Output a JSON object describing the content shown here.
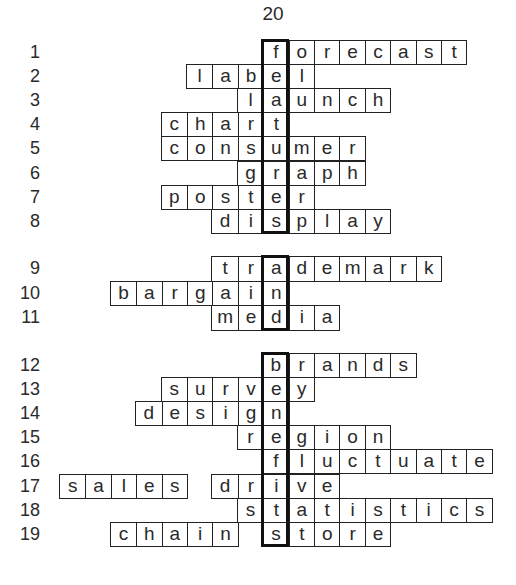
{
  "puzzle": {
    "title": "20",
    "grid": {
      "origin_x": 59,
      "cell_w": 25.4,
      "highlight_col": 8
    },
    "groups": [
      {
        "top": 40,
        "row_h": 24.1,
        "rows": [
          {
            "num": "1",
            "words": [
              {
                "col": 8,
                "text": "forecast"
              }
            ]
          },
          {
            "num": "2",
            "words": [
              {
                "col": 5,
                "text": "label"
              }
            ]
          },
          {
            "num": "3",
            "words": [
              {
                "col": 7,
                "text": "launch"
              }
            ]
          },
          {
            "num": "4",
            "words": [
              {
                "col": 4,
                "text": "chart"
              }
            ]
          },
          {
            "num": "5",
            "words": [
              {
                "col": 4,
                "text": "consumer"
              }
            ]
          },
          {
            "num": "6",
            "words": [
              {
                "col": 7,
                "text": "graph"
              }
            ]
          },
          {
            "num": "7",
            "words": [
              {
                "col": 4,
                "text": "poster"
              }
            ]
          },
          {
            "num": "8",
            "words": [
              {
                "col": 6,
                "text": "display"
              }
            ]
          }
        ]
      },
      {
        "top": 256,
        "row_h": 24.7,
        "rows": [
          {
            "num": "9",
            "words": [
              {
                "col": 6,
                "text": "trademark"
              }
            ]
          },
          {
            "num": "10",
            "words": [
              {
                "col": 2,
                "text": "bargain"
              }
            ]
          },
          {
            "num": "11",
            "words": [
              {
                "col": 6,
                "text": "media"
              }
            ]
          }
        ]
      },
      {
        "top": 353,
        "row_h": 24.1,
        "rows": [
          {
            "num": "12",
            "words": [
              {
                "col": 8,
                "text": "brands"
              }
            ]
          },
          {
            "num": "13",
            "words": [
              {
                "col": 4,
                "text": "survey"
              }
            ]
          },
          {
            "num": "14",
            "words": [
              {
                "col": 3,
                "text": "design"
              }
            ]
          },
          {
            "num": "15",
            "words": [
              {
                "col": 7,
                "text": "region"
              }
            ]
          },
          {
            "num": "16",
            "words": [
              {
                "col": 8,
                "text": "fluctuate"
              }
            ]
          },
          {
            "num": "17",
            "words": [
              {
                "col": 0,
                "text": "sales"
              },
              {
                "col": 6,
                "text": "drive"
              }
            ]
          },
          {
            "num": "18",
            "words": [
              {
                "col": 7,
                "text": "statistics"
              }
            ]
          },
          {
            "num": "19",
            "words": [
              {
                "col": 2,
                "text": "chain"
              },
              {
                "col": 8,
                "text": "store"
              }
            ]
          }
        ]
      }
    ],
    "hidden_word": "feature advertising"
  }
}
